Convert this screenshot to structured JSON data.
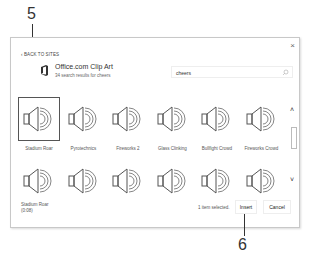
{
  "dialog": {
    "close_label": "×",
    "back_link": "‹ BACK TO SITES",
    "source": {
      "icon": "office-icon",
      "title": "Office.com Clip Art",
      "subtitle": "34 search results for cheers"
    },
    "search": {
      "value": "cheers",
      "icon": "search-icon"
    },
    "results": [
      {
        "label": "Stadium Roar",
        "icon": "speaker-icon",
        "selected": true
      },
      {
        "label": "Pyrotechnics",
        "icon": "speaker-icon",
        "selected": false
      },
      {
        "label": "Fireworks 2",
        "icon": "speaker-icon",
        "selected": false
      },
      {
        "label": "Glass Clinking",
        "icon": "speaker-icon",
        "selected": false
      },
      {
        "label": "Bullfight Crowd",
        "icon": "speaker-icon",
        "selected": false
      },
      {
        "label": "Fireworks Crowd",
        "icon": "speaker-icon",
        "selected": false
      },
      {
        "label": "",
        "icon": "speaker-icon",
        "selected": false
      },
      {
        "label": "",
        "icon": "speaker-icon",
        "selected": false
      },
      {
        "label": "",
        "icon": "speaker-icon",
        "selected": false
      },
      {
        "label": "",
        "icon": "speaker-icon",
        "selected": false
      },
      {
        "label": "",
        "icon": "speaker-icon",
        "selected": false
      },
      {
        "label": "",
        "icon": "speaker-icon",
        "selected": false
      }
    ],
    "scrollbar": {
      "up": "˄",
      "down": "˅"
    },
    "footer": {
      "selected_name": "Stadium Roar",
      "selected_duration": "0:08",
      "status": "1 item selected.",
      "insert_label": "Insert",
      "cancel_label": "Cancel"
    }
  },
  "callouts": [
    {
      "number": "5"
    },
    {
      "number": "6"
    }
  ]
}
